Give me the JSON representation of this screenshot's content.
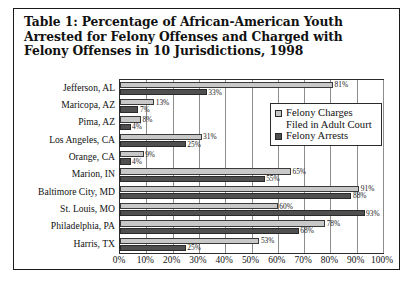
{
  "title": "Table 1: Percentage of African-American Youth Arrested for Felony Offenses and Charged with Felony Offenses in 10 Jurisdictions, 1998",
  "legend": {
    "charges_label": "Felony Charges Filed in Adult Court",
    "arrests_label": "Felony Arrests",
    "charges_color": "#c8c8c8",
    "arrests_color": "#4f4f4f"
  },
  "chart_data": {
    "type": "bar",
    "orientation": "horizontal",
    "title": "Table 1: Percentage of African-American Youth Arrested for Felony Offenses and Charged with Felony Offenses in 10 Jurisdictions, 1998",
    "xlabel": "",
    "ylabel": "",
    "xlim": [
      0,
      100
    ],
    "grid": true,
    "legend_position": "inside-right-top",
    "xticks": [
      "0%",
      "10%",
      "20%",
      "30%",
      "40%",
      "50%",
      "60%",
      "70%",
      "80%",
      "90%",
      "100%"
    ],
    "xtick_values": [
      0,
      10,
      20,
      30,
      40,
      50,
      60,
      70,
      80,
      90,
      100
    ],
    "categories": [
      "Jefferson, AL",
      "Maricopa, AZ",
      "Pima, AZ",
      "Los Angeles, CA",
      "Orange, CA",
      "Marion, IN",
      "Baltimore City, MD",
      "St. Louis, MO",
      "Philadelphia, PA",
      "Harris, TX"
    ],
    "series": [
      {
        "name": "Felony Charges Filed in Adult Court",
        "color": "#c8c8c8",
        "values": [
          81,
          13,
          8,
          31,
          9,
          65,
          91,
          60,
          78,
          53
        ],
        "labels": [
          "81%",
          "13%",
          "8%",
          "31%",
          "9%",
          "65%",
          "91%",
          "60%",
          "78%",
          "53%"
        ]
      },
      {
        "name": "Felony Arrests",
        "color": "#4f4f4f",
        "values": [
          33,
          7,
          4,
          25,
          4,
          55,
          88,
          93,
          68,
          25
        ],
        "labels": [
          "33%",
          "7%",
          "4%",
          "25%",
          "4%",
          "55%",
          "88%",
          "93%",
          "68%",
          "25%"
        ]
      }
    ]
  }
}
